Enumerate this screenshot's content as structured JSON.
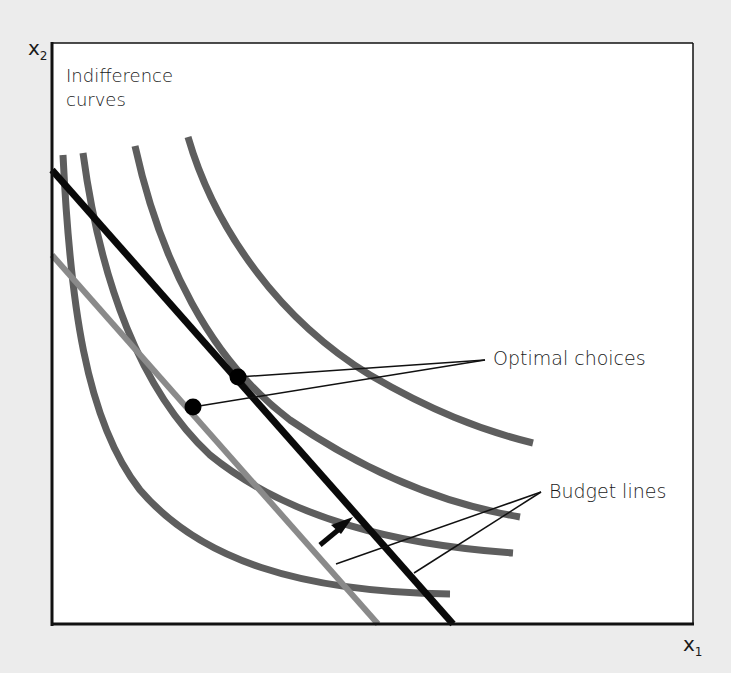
{
  "diagram": {
    "type": "indifference-curves-budget-lines",
    "axes": {
      "x_label": "x",
      "x_sub": "1",
      "y_label": "x",
      "y_sub": "2"
    },
    "title": {
      "line1": "Indifference",
      "line2": "curves"
    },
    "annotations": {
      "optimal_choices": "Optimal choices",
      "budget_lines": "Budget lines"
    },
    "colors": {
      "background": "#ececec",
      "plot_area": "#ffffff",
      "axis": "#111111",
      "indifference_curve": "#5e5e5e",
      "old_budget_line": "#8a8a8a",
      "new_budget_line": "#0a0a0a",
      "optimal_point": "#000000"
    },
    "elements": {
      "indifference_curves": 4,
      "budget_lines": [
        "lower (gray, original)",
        "higher (black, shifted outward)"
      ],
      "optimal_points": 2,
      "shift_arrow": "parallel outward shift of budget line"
    }
  }
}
